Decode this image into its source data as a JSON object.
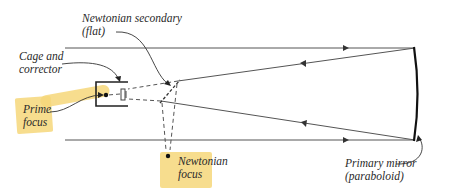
{
  "diagram": {
    "type": "newtonian-telescope-optics",
    "labels": {
      "secondary_line1": "Newtonian secondary",
      "secondary_line2": "(flat)",
      "cage_line1": "Cage and",
      "cage_line2": "corrector",
      "prime_line1": "Prime",
      "prime_line2": "focus",
      "newt_focus_line1": "Newtonian",
      "newt_focus_line2": "focus",
      "primary_line1": "Primary mirror",
      "primary_line2": "(paraboloid)"
    },
    "colors": {
      "line": "#3a3a3a",
      "mirror": "#111111",
      "highlight": "#f6d77a",
      "text": "#2a2a2a"
    }
  }
}
